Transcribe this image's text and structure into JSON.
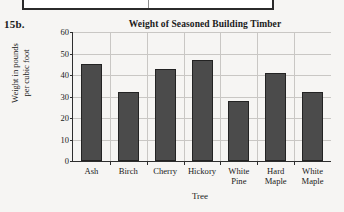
{
  "exercise": {
    "number": "15b."
  },
  "top_frame": {
    "present": true
  },
  "chart_data": {
    "type": "bar",
    "title": "Weight of Seasoned Building Timber",
    "xlabel": "Tree",
    "ylabel": "Weight in pounds\nper cubic foot",
    "ylabel_line1": "Weight in pounds",
    "ylabel_line2": "per cubic foot",
    "categories": [
      "Ash",
      "Birch",
      "Cherry",
      "Hickory",
      "White\nPine",
      "Hard\nMaple",
      "White\nMaple"
    ],
    "values": [
      45,
      32,
      43,
      47,
      28,
      41,
      32
    ],
    "ylim": [
      0,
      60
    ],
    "ytick_values": [
      0,
      10,
      20,
      30,
      40,
      50,
      60
    ],
    "ytick_labels": [
      "0",
      "10",
      "20",
      "30",
      "40",
      "50",
      "60"
    ],
    "grid": "horizontal-and-vertical",
    "legend": "none",
    "bar_color": "#4b4b4b",
    "bar_edge_color": "#232323",
    "grid_color": "#c9c7c4",
    "axis_color": "#2e2e2e",
    "background_color": "#f6f5f3"
  }
}
